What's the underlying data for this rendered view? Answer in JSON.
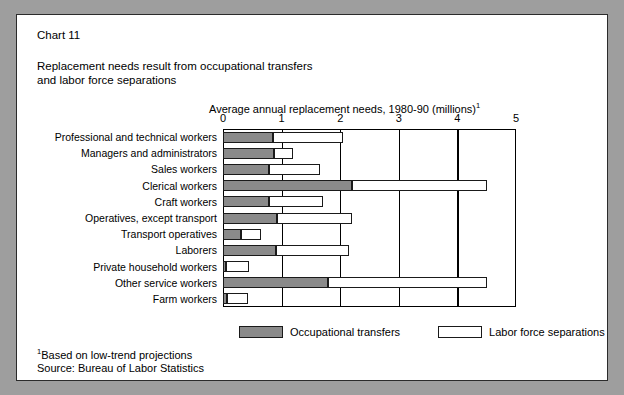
{
  "card": {
    "chart_number": "Chart 11",
    "subtitle_line1": "Replacement needs result from occupational transfers",
    "subtitle_line2": "and labor force separations"
  },
  "footnotes": {
    "marker": "1",
    "basis": "Based on low-trend projections",
    "source": "Source: Bureau of Labor Statistics"
  },
  "legend": {
    "transfers_label": "Occupational transfers",
    "separations_label": "Labor force separations"
  },
  "colors": {
    "transfers": "#8a8a8a",
    "separations": "#ffffff",
    "outline": "#1a1a1a",
    "page_background": "#9e9e9e",
    "card_background": "#ffffff"
  },
  "chart_data": {
    "type": "bar",
    "orientation": "horizontal",
    "stacked": true,
    "title": "Replacement needs result from occupational transfers and labor force separations",
    "subtitle": "Chart 11",
    "xlabel": "Average annual replacement needs, 1980-90 (millions)",
    "xlabel_footnote": "1",
    "ylabel": "",
    "xlim": [
      0,
      5
    ],
    "xticks": [
      0,
      1,
      2,
      3,
      4,
      5
    ],
    "xtick_labels": [
      "0",
      "1",
      "2",
      "3",
      "4",
      "5"
    ],
    "grid": true,
    "legend_position": "bottom",
    "categories": [
      "Professional and technical workers",
      "Managers and administrators",
      "Sales workers",
      "Clerical workers",
      "Craft workers",
      "Operatives, except transport",
      "Transport operatives",
      "Laborers",
      "Private household workers",
      "Other service workers",
      "Farm workers"
    ],
    "series": [
      {
        "name": "Occupational transfers",
        "color": "#8a8a8a",
        "values": [
          0.85,
          0.87,
          0.78,
          2.2,
          0.78,
          0.92,
          0.3,
          0.9,
          0.05,
          1.8,
          0.07
        ]
      },
      {
        "name": "Labor force separations",
        "color": "#ffffff",
        "values": [
          1.2,
          0.33,
          0.87,
          2.3,
          0.92,
          1.28,
          0.35,
          1.25,
          0.4,
          2.7,
          0.35
        ]
      }
    ],
    "totals": [
      2.05,
      1.2,
      1.65,
      4.5,
      1.7,
      2.2,
      0.65,
      2.15,
      0.45,
      4.5,
      0.42
    ]
  }
}
